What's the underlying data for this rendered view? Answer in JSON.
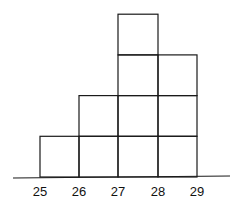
{
  "chart_data": {
    "type": "bar",
    "style": "stacked-unit-boxes histogram",
    "title": "",
    "xlabel": "",
    "ylabel": "",
    "categories": [
      "25-26",
      "26-27",
      "27-28",
      "28-29"
    ],
    "bin_edges": [
      25,
      26,
      27,
      28,
      29
    ],
    "values": [
      1,
      2,
      4,
      3
    ],
    "tick_labels": [
      "25",
      "26",
      "27",
      "28",
      "29"
    ],
    "ylim": [
      0,
      4
    ],
    "grid": false,
    "legend": null
  },
  "axis": {
    "ticks": [
      {
        "label": "25",
        "x": 40
      },
      {
        "label": "26",
        "x": 79
      },
      {
        "label": "27",
        "x": 118
      },
      {
        "label": "28",
        "x": 158
      },
      {
        "label": "29",
        "x": 197
      }
    ]
  },
  "colors": {
    "line": "#1a1a1a",
    "background": "#ffffff"
  }
}
